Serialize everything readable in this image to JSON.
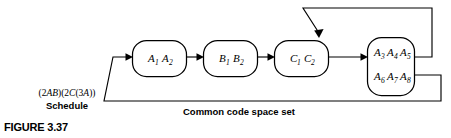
{
  "figure": {
    "number": "FIGURE 3.37",
    "schedule_expression": "(2AB)(2C(3A))",
    "schedule_label": "Schedule",
    "bottom_caption": "Common code space set"
  },
  "diagram": {
    "type": "block-flow-diagram",
    "stroke_color": "#000000",
    "background_color": "#ffffff",
    "nodes": [
      {
        "id": "node-a",
        "rows": [
          {
            "items": [
              {
                "base": "A",
                "sub": "1"
              },
              {
                "base": "A",
                "sub": "2"
              }
            ]
          }
        ]
      },
      {
        "id": "node-b",
        "rows": [
          {
            "items": [
              {
                "base": "B",
                "sub": "1"
              },
              {
                "base": "B",
                "sub": "2"
              }
            ]
          }
        ]
      },
      {
        "id": "node-c",
        "rows": [
          {
            "items": [
              {
                "base": "C",
                "sub": "1"
              },
              {
                "base": "C",
                "sub": "2"
              }
            ]
          }
        ]
      },
      {
        "id": "node-d",
        "rows": [
          {
            "items": [
              {
                "base": "A",
                "sub": "3"
              },
              {
                "base": "A",
                "sub": "4"
              },
              {
                "base": "A",
                "sub": "5"
              }
            ]
          },
          {
            "items": [
              {
                "base": "A",
                "sub": "6"
              },
              {
                "base": "A",
                "sub": "7"
              },
              {
                "base": "A",
                "sub": "8"
              }
            ]
          }
        ]
      }
    ],
    "labels": {
      "node_a_r0_i0": "A",
      "node_a_r0_i0_sub": "1",
      "node_a_r0_i1": "A",
      "node_a_r0_i1_sub": "2",
      "node_b_r0_i0": "B",
      "node_b_r0_i0_sub": "1",
      "node_b_r0_i1": "B",
      "node_b_r0_i1_sub": "2",
      "node_c_r0_i0": "C",
      "node_c_r0_i0_sub": "1",
      "node_c_r0_i1": "C",
      "node_c_r0_i1_sub": "2",
      "node_d_r0_i0": "A",
      "node_d_r0_i0_sub": "3",
      "node_d_r0_i1": "A",
      "node_d_r0_i1_sub": "4",
      "node_d_r0_i2": "A",
      "node_d_r0_i2_sub": "5",
      "node_d_r1_i0": "A",
      "node_d_r1_i0_sub": "6",
      "node_d_r1_i1": "A",
      "node_d_r1_i1_sub": "7",
      "node_d_r1_i2": "A",
      "node_d_r1_i2_sub": "8"
    },
    "connections": [
      {
        "id": "conn-a-to-b",
        "from": "node-a",
        "to": "node-b",
        "arrow": true
      },
      {
        "id": "conn-b-to-c",
        "from": "node-b",
        "to": "node-c",
        "arrow": true
      },
      {
        "id": "conn-c-to-d",
        "from": "node-c",
        "to": "node-d",
        "arrow": true
      },
      {
        "id": "conn-feedback-top",
        "from": "node-d",
        "to": "node-c",
        "arrow": true
      },
      {
        "id": "conn-feedback-bottom",
        "from": "node-d",
        "to": "node-a",
        "arrow": true
      }
    ]
  }
}
